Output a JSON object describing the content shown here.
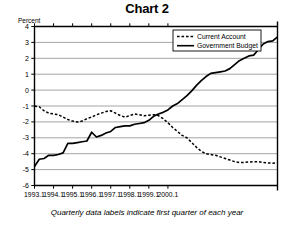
{
  "chart_data": {
    "type": "line",
    "title": "Chart 2",
    "ylabel": "Percent",
    "xlabel": "",
    "footnote": "Quarterly data labels indicate first quarter of each year",
    "ylim": [
      -6,
      4
    ],
    "yticks": [
      4,
      3,
      2,
      1,
      0,
      -1,
      -2,
      -3,
      -4,
      -5,
      -6
    ],
    "ytick_labels": [
      "4",
      "3",
      "2",
      "1",
      "0",
      "-1",
      "-2",
      "-3",
      "-4",
      "-5",
      "-6"
    ],
    "grid": true,
    "legend_position": "top-right",
    "xtick_labels": [
      "1993.1",
      "1994.1",
      "1995.1",
      "1996.1",
      "1997.1",
      "1998.1",
      "1999.1",
      "2000.1"
    ],
    "x_start": 1993.0,
    "x_end": 2000.75,
    "x_step_quarters": 0.25,
    "series": [
      {
        "name": "Current Account",
        "style": "dashed",
        "color": "#000000",
        "values": [
          -1.0,
          -1.05,
          -1.3,
          -1.45,
          -1.5,
          -1.55,
          -1.7,
          -1.85,
          -1.95,
          -2.0,
          -1.95,
          -1.8,
          -1.7,
          -1.55,
          -1.45,
          -1.35,
          -1.3,
          -1.45,
          -1.6,
          -1.7,
          -1.6,
          -1.5,
          -1.55,
          -1.62,
          -1.58,
          -1.55,
          -1.6,
          -1.8,
          -2.05,
          -2.35,
          -2.6,
          -2.85,
          -3.0,
          -3.3,
          -3.6,
          -3.85,
          -4.0,
          -4.05,
          -4.1,
          -4.2,
          -4.3,
          -4.4,
          -4.5,
          -4.55,
          -4.55,
          -4.52,
          -4.5,
          -4.5,
          -4.55,
          -4.58,
          -4.6,
          -4.58
        ]
      },
      {
        "name": "Government Budget",
        "style": "solid",
        "color": "#000000",
        "values": [
          -4.8,
          -4.35,
          -4.3,
          -4.1,
          -4.1,
          -4.05,
          -3.95,
          -3.35,
          -3.35,
          -3.3,
          -3.25,
          -3.2,
          -2.65,
          -2.95,
          -2.85,
          -2.7,
          -2.6,
          -2.35,
          -2.3,
          -2.25,
          -2.25,
          -2.15,
          -2.1,
          -2.05,
          -1.9,
          -1.65,
          -1.5,
          -1.4,
          -1.25,
          -1.0,
          -0.85,
          -0.6,
          -0.35,
          -0.05,
          0.3,
          0.6,
          0.85,
          1.05,
          1.1,
          1.15,
          1.2,
          1.35,
          1.6,
          1.85,
          2.0,
          2.15,
          2.2,
          2.55,
          2.9,
          3.05,
          3.1,
          3.35
        ]
      }
    ]
  },
  "legend": {
    "items": [
      {
        "label": "Current Account",
        "style": "dashed"
      },
      {
        "label": "Government Budget",
        "style": "solid"
      }
    ]
  }
}
